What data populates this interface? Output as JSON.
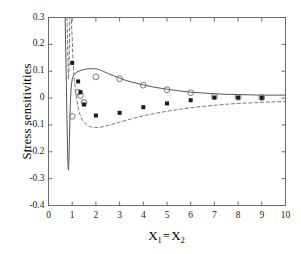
{
  "figure": {
    "background": "#ffffff",
    "axis_color": "#6b6b6b",
    "series_solid_color": "#555555",
    "series_dashed_color": "#777777",
    "marker_open_color": "#777777",
    "marker_filled_color": "#1a1a1a"
  },
  "axes": {
    "x_label_prefix": "X",
    "x_label_sub1": "1",
    "x_label_eq": "=",
    "x_label_prefix2": "X",
    "x_label_sub2": "2",
    "y_label": "Stress  sensitivities"
  },
  "chart_data": {
    "type": "line",
    "title": "",
    "xlabel": "X1 = X2",
    "ylabel": "Stress sensitivities",
    "xlim": [
      0,
      10
    ],
    "ylim": [
      -0.4,
      0.3
    ],
    "xticks": [
      "0",
      "1",
      "2",
      "3",
      "4",
      "5",
      "6",
      "7",
      "8",
      "9",
      "10"
    ],
    "xtick_values": [
      0,
      1,
      2,
      3,
      4,
      5,
      6,
      7,
      8,
      9,
      10
    ],
    "yticks": [
      "0.3",
      "0.2",
      "0.1",
      "0",
      "-0.1",
      "-0.2",
      "-0.3",
      "-0.4"
    ],
    "ytick_values": [
      0.3,
      0.2,
      0.1,
      0,
      -0.1,
      -0.2,
      -0.3,
      -0.4
    ],
    "grid": false,
    "legend": null,
    "series": [
      {
        "name": "solid-curve",
        "style": "solid",
        "color": "#555555",
        "x": [
          0.7,
          0.74,
          0.78,
          0.8,
          0.82,
          0.84,
          0.86,
          0.88,
          0.92,
          0.96,
          1.0,
          1.05,
          1.1,
          1.15,
          1.2,
          1.3,
          1.4,
          1.5,
          1.6,
          1.75,
          1.9,
          2.0,
          2.1,
          2.25,
          2.5,
          2.75,
          3.0,
          3.25,
          3.5,
          4.0,
          4.5,
          5.0,
          5.5,
          6.0,
          6.5,
          7.0,
          7.5,
          8.0,
          8.5,
          9.0,
          9.5,
          10.0
        ],
        "y": [
          0.3,
          0.12,
          -0.08,
          -0.18,
          -0.24,
          -0.268,
          -0.24,
          -0.16,
          -0.02,
          0.045,
          0.07,
          0.083,
          0.089,
          0.094,
          0.097,
          0.101,
          0.104,
          0.106,
          0.108,
          0.109,
          0.1095,
          0.109,
          0.107,
          0.102,
          0.092,
          0.083,
          0.074,
          0.066,
          0.06,
          0.049,
          0.04,
          0.033,
          0.027,
          0.022,
          0.019,
          0.016,
          0.014,
          0.013,
          0.012,
          0.011,
          0.011,
          0.011
        ]
      },
      {
        "name": "dashed-curve",
        "style": "dashed",
        "color": "#777777",
        "x": [
          0.78,
          0.8,
          0.82,
          0.84,
          0.86,
          0.88,
          0.9,
          0.96,
          1.0,
          1.04,
          1.08,
          1.12,
          1.16,
          1.2,
          1.25,
          1.3,
          1.4,
          1.5,
          1.6,
          1.75,
          1.9,
          2.0,
          2.1,
          2.25,
          2.5,
          2.75,
          3.0,
          3.5,
          4.0,
          4.5,
          5.0,
          5.5,
          6.0,
          6.5,
          7.0,
          7.5,
          8.0,
          8.5,
          9.0,
          9.5,
          10.0
        ],
        "y": [
          0.3,
          0.22,
          0.14,
          0.07,
          0.1,
          0.18,
          0.3,
          0.3,
          0.22,
          0.13,
          0.08,
          0.04,
          0.01,
          -0.01,
          -0.035,
          -0.055,
          -0.078,
          -0.09,
          -0.099,
          -0.106,
          -0.109,
          -0.11,
          -0.1095,
          -0.108,
          -0.102,
          -0.096,
          -0.09,
          -0.077,
          -0.066,
          -0.057,
          -0.049,
          -0.042,
          -0.036,
          -0.031,
          -0.027,
          -0.023,
          -0.02,
          -0.018,
          -0.016,
          -0.014,
          -0.013
        ]
      }
    ],
    "markers": [
      {
        "name": "open-circles",
        "shape": "open-circle",
        "color": "#777777",
        "x": [
          1.0,
          1.25,
          1.35,
          1.5,
          2.0,
          3.0,
          4.0,
          5.0,
          6.0,
          7.0,
          8.0,
          9.0
        ],
        "y": [
          -0.068,
          0.022,
          0.01,
          -0.016,
          0.079,
          0.072,
          0.048,
          0.031,
          0.02,
          0.006,
          0.003,
          0.002
        ]
      },
      {
        "name": "filled-squares",
        "shape": "filled-square",
        "color": "#1a1a1a",
        "x": [
          1.0,
          1.25,
          1.35,
          1.5,
          2.0,
          3.0,
          4.0,
          5.0,
          6.0,
          7.0,
          8.0,
          9.0
        ],
        "y": [
          0.131,
          0.062,
          0.022,
          -0.024,
          -0.065,
          -0.055,
          -0.034,
          -0.02,
          -0.008,
          0.002,
          0.002,
          0.001
        ]
      }
    ]
  }
}
